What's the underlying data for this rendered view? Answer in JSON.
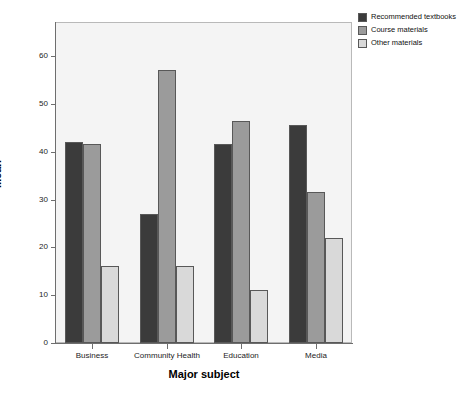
{
  "chart_data": {
    "type": "bar",
    "title": "",
    "xlabel": "Major subject",
    "ylabel": "Mean",
    "categories": [
      "Business",
      "Community Health",
      "Education",
      "Media"
    ],
    "series": [
      {
        "name": "Recommended textbooks",
        "color": "#3b3b3b",
        "values": [
          42,
          27,
          41.5,
          45.5
        ]
      },
      {
        "name": "Course materials",
        "color": "#9b9b9b",
        "values": [
          41.5,
          57,
          46.5,
          31.5
        ]
      },
      {
        "name": "Other materials",
        "color": "#d9d9d9",
        "values": [
          16,
          16,
          11,
          22
        ]
      }
    ],
    "ylim": [
      0,
      65
    ],
    "yticks": [
      0,
      10,
      20,
      30,
      40,
      50,
      60
    ],
    "ytick_labels": [
      "0",
      "10",
      "20",
      "30",
      "40",
      "50",
      "60"
    ],
    "grid": false,
    "legend_position": "top-right",
    "plot_background": "#f4f4f4",
    "axis_color": "#6e6e6e"
  }
}
